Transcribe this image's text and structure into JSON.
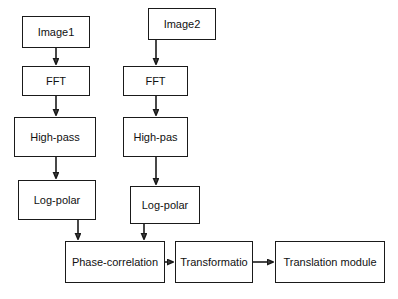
{
  "diagram": {
    "background": "#ffffff",
    "stroke_color": "#1a1a1a",
    "node_fill": "#ffffff",
    "text_color": "#111111",
    "nodes": [
      {
        "id": "image1",
        "label": "Image1",
        "x": 22,
        "y": 16,
        "w": 68,
        "h": 32
      },
      {
        "id": "fft-left",
        "label": "FFT",
        "x": 22,
        "y": 66,
        "w": 68,
        "h": 30
      },
      {
        "id": "highpass-left",
        "label": "High-pass",
        "x": 14,
        "y": 117,
        "w": 82,
        "h": 40
      },
      {
        "id": "logpolar-left",
        "label": "Log-polar",
        "x": 18,
        "y": 180,
        "w": 78,
        "h": 40
      },
      {
        "id": "image2",
        "label": "Image2",
        "x": 148,
        "y": 8,
        "w": 68,
        "h": 32
      },
      {
        "id": "fft-right",
        "label": "FFT",
        "x": 123,
        "y": 66,
        "w": 65,
        "h": 30
      },
      {
        "id": "highpass-right",
        "label": "High-pas",
        "x": 123,
        "y": 117,
        "w": 65,
        "h": 40
      },
      {
        "id": "logpolar-right",
        "label": "Log-polar",
        "x": 130,
        "y": 186,
        "w": 70,
        "h": 38
      },
      {
        "id": "phase-correlation",
        "label": "Phase-correlation",
        "x": 65,
        "y": 241,
        "w": 100,
        "h": 42
      },
      {
        "id": "transformation",
        "label": "Transformatio",
        "x": 175,
        "y": 241,
        "w": 78,
        "h": 42
      },
      {
        "id": "translation",
        "label": "Translation module",
        "x": 275,
        "y": 241,
        "w": 110,
        "h": 42
      }
    ],
    "edges": [
      {
        "id": "image1-to-fft",
        "from": "image1",
        "to": "fft-left",
        "kind": "vertical"
      },
      {
        "id": "fftleft-to-highpass",
        "from": "fft-left",
        "to": "highpass-left",
        "kind": "vertical"
      },
      {
        "id": "highpassleft-to-logp",
        "from": "highpass-left",
        "to": "logpolar-left",
        "kind": "vertical"
      },
      {
        "id": "logpleft-to-phase",
        "from": "logpolar-left",
        "to": "phase-correlation",
        "kind": "vertical"
      },
      {
        "id": "image2-to-fft",
        "from": "image2",
        "to": "fft-right",
        "kind": "vertical"
      },
      {
        "id": "fftright-to-highpass",
        "from": "fft-right",
        "to": "highpass-right",
        "kind": "vertical"
      },
      {
        "id": "highpassright-to-logp",
        "from": "highpass-right",
        "to": "logpolar-right",
        "kind": "vertical"
      },
      {
        "id": "logpright-to-phase",
        "from": "logpolar-right",
        "to": "phase-correlation",
        "kind": "vertical"
      },
      {
        "id": "phase-to-transform",
        "from": "phase-correlation",
        "to": "transformation",
        "kind": "horizontal"
      },
      {
        "id": "transform-to-translate",
        "from": "transformation",
        "to": "translation",
        "kind": "horizontal"
      }
    ]
  }
}
